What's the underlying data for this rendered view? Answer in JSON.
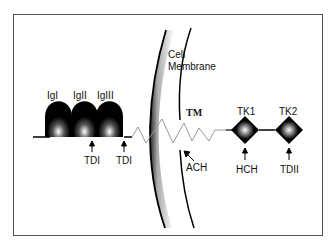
{
  "diagram": {
    "membrane_label": [
      "Cell",
      "Membrane"
    ],
    "ig_domains": [
      {
        "label": "IgI"
      },
      {
        "label": "IgII"
      },
      {
        "label": "IgIII"
      }
    ],
    "transmembrane_label": "TM",
    "kinase_domains": [
      {
        "label": "TK1"
      },
      {
        "label": "TK2"
      }
    ],
    "annotations": [
      {
        "label": "TDI",
        "position": "between IgII and IgIII"
      },
      {
        "label": "TDI",
        "position": "after IgIII"
      },
      {
        "label": "ACH",
        "position": "juxtamembrane"
      },
      {
        "label": "HCH",
        "position": "below TK1"
      },
      {
        "label": "TDII",
        "position": "below TK2"
      }
    ],
    "colors": {
      "domain_fill": "#000000",
      "zigzag": "#999999",
      "frame": "#555555",
      "background": "#ffffff"
    }
  }
}
